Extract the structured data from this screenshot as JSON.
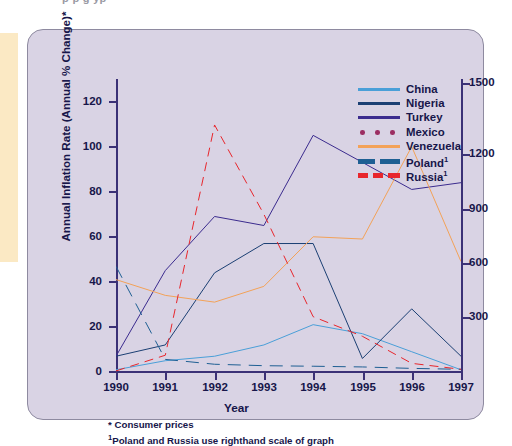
{
  "page": {
    "top_cut_text": "p                         p            g                               yp"
  },
  "figure": {
    "ylabel": "Annual Inflation Rate (Annual % Change)*",
    "xlabel": "Year",
    "left_ticks": [
      "0",
      "20",
      "40",
      "60",
      "80",
      "100",
      "120"
    ],
    "right_ticks": [
      "300",
      "600",
      "900",
      "1200",
      "1500"
    ],
    "x_ticks": [
      "1990",
      "1991",
      "1992",
      "1993",
      "1994",
      "1995",
      "1996",
      "1997"
    ],
    "notes": [
      "* Consumer prices",
      "Poland and Russia use righthand scale of graph"
    ],
    "note_marker": "1"
  },
  "legend": {
    "position": "top-right",
    "items": [
      {
        "label": "China",
        "sup": "",
        "color": "#4a9fd8",
        "style": "solid",
        "width": 3.0
      },
      {
        "label": "Nigeria",
        "sup": "",
        "color": "#1b3f73",
        "style": "solid",
        "width": 3.4
      },
      {
        "label": "Turkey",
        "sup": "",
        "color": "#3b2b8e",
        "style": "solid",
        "width": 3.0
      },
      {
        "label": "Mexico",
        "sup": "",
        "color": "#9c2e62",
        "style": "dotted",
        "width": 4.6
      },
      {
        "label": "Venezuela",
        "sup": "",
        "color": "#f3a258",
        "style": "solid",
        "width": 2.8
      },
      {
        "label": "Poland",
        "sup": "1",
        "color": "#1e5f93",
        "style": "dashed",
        "width": 5.0
      },
      {
        "label": "Russia",
        "sup": "1",
        "color": "#e8262c",
        "style": "dashed",
        "width": 4.6
      }
    ]
  },
  "chart_data": {
    "type": "line",
    "title": "",
    "xlabel": "Year",
    "ylabel": "Annual Inflation Rate (Annual % Change)*",
    "x": [
      1990,
      1991,
      1992,
      1993,
      1994,
      1995,
      1996,
      1997
    ],
    "ylim": [
      0,
      130
    ],
    "ylim_right": [
      0,
      1625
    ],
    "y2label": "",
    "grid": false,
    "legend_position": "top-right",
    "series": [
      {
        "name": "China",
        "axis": "left",
        "color": "#4a9fd8",
        "style": "solid",
        "values": [
          1,
          5,
          7,
          12,
          21,
          17,
          9,
          1
        ]
      },
      {
        "name": "Nigeria",
        "axis": "left",
        "color": "#1b3f73",
        "style": "solid",
        "values": [
          7,
          12,
          44,
          57,
          57,
          6,
          28,
          7
        ]
      },
      {
        "name": "Turkey",
        "axis": "left",
        "color": "#3b2b8e",
        "style": "solid",
        "values": [
          7,
          45,
          69,
          65,
          105,
          93,
          81,
          84
        ]
      },
      {
        "name": "Mexico",
        "axis": "left",
        "color": "#9c2e62",
        "style": "dotted",
        "values": [
          26,
          23,
          16,
          10,
          7,
          32,
          34,
          19
        ]
      },
      {
        "name": "Venezuela",
        "axis": "left",
        "color": "#f3a258",
        "style": "solid",
        "values": [
          41,
          34,
          31,
          38,
          60,
          59,
          100,
          49
        ]
      },
      {
        "name": "Poland",
        "axis": "right",
        "color": "#1e5f93",
        "style": "dashed",
        "values": [
          586,
          70,
          43,
          35,
          32,
          28,
          20,
          15
        ]
      },
      {
        "name": "Russia",
        "axis": "right",
        "color": "#e8262c",
        "style": "dashed",
        "values": [
          6,
          93,
          1370,
          875,
          307,
          198,
          48,
          15
        ]
      }
    ]
  }
}
